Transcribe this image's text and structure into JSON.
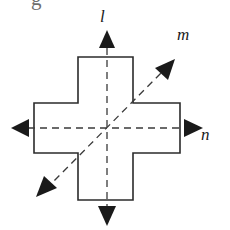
{
  "figure": {
    "background_color": "#ffffff",
    "stroke_color": "#2b2b2b",
    "dash_color": "#3a3a3a",
    "arrow_color": "#1a1a1a",
    "label_color": "#1a1a1a",
    "cropped_glyph": {
      "text": "g",
      "color": "#6e6e6e"
    },
    "shape": {
      "name": "cross",
      "center": {
        "x": 107,
        "y": 128
      },
      "outline_width": 1.6,
      "points": "78,57 133,57 133,103 180,103 180,153 133,153 133,200 78,200 78,153 34,153 34,103 78,103",
      "bounds": {
        "left": 34,
        "top": 57,
        "right": 180,
        "bottom": 200
      }
    },
    "axes": [
      {
        "id": "l",
        "label": "l",
        "orientation": "vertical",
        "dashed": true,
        "arrowheads": [
          "up",
          "down"
        ],
        "x1": 107,
        "y1": 36,
        "x2": 107,
        "y2": 220,
        "label_x": 100,
        "label_y": 8
      },
      {
        "id": "m",
        "label": "m",
        "orientation": "diagonal",
        "dashed": true,
        "arrowheads": [
          "up-right",
          "down-left"
        ],
        "x1": 46,
        "y1": 189,
        "x2": 168,
        "y2": 66,
        "label_x": 177,
        "label_y": 26
      },
      {
        "id": "n",
        "label": "n",
        "orientation": "horizontal",
        "dashed": true,
        "arrowheads": [
          "left",
          "right"
        ],
        "x1": 16,
        "y1": 128,
        "x2": 198,
        "y2": 128,
        "label_x": 201,
        "label_y": 126
      }
    ],
    "arrowheads": [
      {
        "name": "arrowhead-up",
        "points": "107,30 99,48 115,48"
      },
      {
        "name": "arrowhead-down",
        "points": "107,226 98,206 116,206"
      },
      {
        "name": "arrowhead-left",
        "points": "11,128 29,119 29,137"
      },
      {
        "name": "arrowhead-right",
        "points": "203,128 184,119 184,137"
      },
      {
        "name": "arrowhead-up-right",
        "points": "175,59 155,68 168,80"
      },
      {
        "name": "arrowhead-down-left",
        "points": "36,197 57,188 44,176"
      }
    ]
  }
}
